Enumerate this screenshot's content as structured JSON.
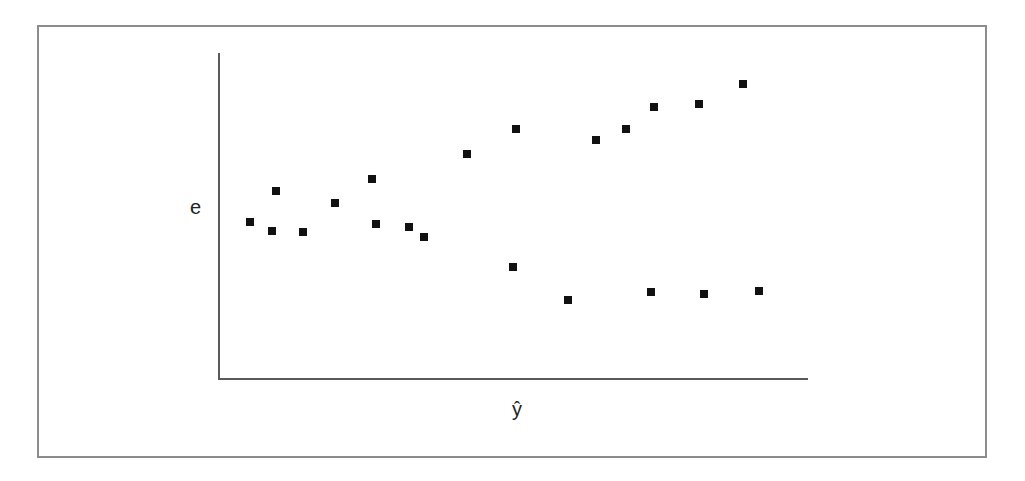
{
  "chart_data": {
    "type": "scatter",
    "title": "",
    "xlabel": "ŷ",
    "ylabel": "e",
    "xlim": [
      0,
      100
    ],
    "ylim": [
      0,
      100
    ],
    "grid": false,
    "legend": null,
    "ticks": "none",
    "series": [
      {
        "name": "residuals",
        "color": "#111111",
        "marker": "square",
        "points": [
          {
            "x": 5.4,
            "y": 48.0
          },
          {
            "x": 9.8,
            "y": 57.5
          },
          {
            "x": 9.2,
            "y": 45.2
          },
          {
            "x": 14.4,
            "y": 44.9
          },
          {
            "x": 19.8,
            "y": 53.8
          },
          {
            "x": 26.1,
            "y": 61.2
          },
          {
            "x": 26.8,
            "y": 47.4
          },
          {
            "x": 32.4,
            "y": 46.5
          },
          {
            "x": 34.9,
            "y": 43.4
          },
          {
            "x": 42.2,
            "y": 68.9
          },
          {
            "x": 50.5,
            "y": 76.6
          },
          {
            "x": 50.0,
            "y": 34.2
          },
          {
            "x": 59.3,
            "y": 24.0
          },
          {
            "x": 64.1,
            "y": 73.2
          },
          {
            "x": 69.2,
            "y": 76.6
          },
          {
            "x": 73.9,
            "y": 83.4
          },
          {
            "x": 73.4,
            "y": 26.5
          },
          {
            "x": 81.5,
            "y": 84.3
          },
          {
            "x": 82.4,
            "y": 25.8
          },
          {
            "x": 88.9,
            "y": 90.5
          },
          {
            "x": 91.7,
            "y": 26.8
          }
        ]
      }
    ]
  }
}
